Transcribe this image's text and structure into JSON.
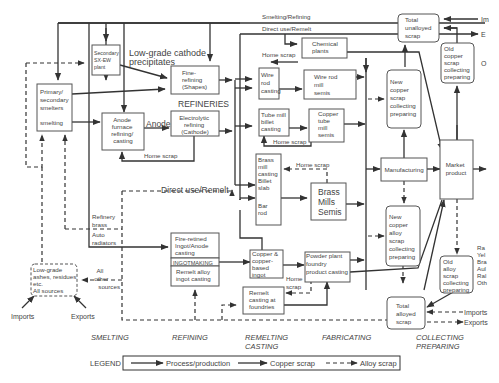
{
  "diagram": {
    "nodes": {
      "primary_smelters": [
        "Primary/",
        "secondary",
        "smelters",
        "",
        "smelting"
      ],
      "secondary_sxew": [
        "Secondary",
        "SX-EW",
        "plant"
      ],
      "fine_refining": [
        "Fine-",
        "refining",
        "(Shapes)"
      ],
      "anode_furnace": [
        "Anode",
        "furnace",
        "refining/",
        "casting"
      ],
      "electrolytic": [
        "Electrolytic",
        "refining",
        "(Cathode)"
      ],
      "chemical_plants": [
        "Chemical",
        "plants"
      ],
      "wire_rod_casting": [
        "Wire",
        "rod",
        "casting"
      ],
      "wire_rod_semis": [
        "Wire rod",
        "mill",
        "semis"
      ],
      "tube_billet": [
        "Tube mill",
        "billet",
        "casting"
      ],
      "copper_tube_semis": [
        "Copper",
        "tube",
        "mill",
        "semis"
      ],
      "brass_mill_casting": [
        "Brass",
        "mill",
        "casting",
        "Billet",
        "slab",
        "",
        "Bar",
        "rod"
      ],
      "brass_mills_semis": [
        "Brass",
        "Mills",
        "Semis"
      ],
      "new_copper_scrap": [
        "New",
        "copper",
        "scrap",
        "collecting",
        "preparing"
      ],
      "total_unalloyed": [
        "Total",
        "unalloyed",
        "scrap"
      ],
      "old_copper_scrap": [
        "Old",
        "copper",
        "scrap",
        "collecting",
        "preparing"
      ],
      "manufacturing": [
        "Manufacturing"
      ],
      "market_product": [
        "Market",
        "product"
      ],
      "new_alloy_scrap": [
        "New",
        "copper",
        "alloy",
        "scrap",
        "collecting",
        "preparing"
      ],
      "old_alloy_scrap": [
        "Old",
        "alloy",
        "scrap",
        "collecting",
        "preparing"
      ],
      "total_alloyed": [
        "Total",
        "alloyed",
        "scrap"
      ],
      "fire_refined": [
        "Fire-retined",
        "Ingot/Anode",
        "casting"
      ],
      "ingotmaking": "INGOTMAKING",
      "remelt_alloy": [
        "Remelt alloy",
        "ingot casting"
      ],
      "copper_based_ingot": [
        "Copper &",
        "copper-",
        "based",
        "ingot"
      ],
      "powder_plant": [
        "Powder plant",
        "foundry",
        "product casting"
      ],
      "remelt_foundries": [
        "Remelt",
        "casting at",
        "foundries"
      ],
      "low_grade": [
        "Low-grade",
        "ashes, residues",
        "etc.",
        "All sources"
      ]
    },
    "labels": {
      "smelting_refining": "Smelting/Refining",
      "direct_use_remelt_top": "Direct use/Remelt",
      "low_grade_cathode": [
        "Low-grade cathode",
        "precipitates"
      ],
      "refineries": "REFINERIES",
      "anode": "Anode",
      "home_scrap_anode": "Home scrap",
      "home_scrap_wire": "Home scrap",
      "home_scrap_tube": "Home scrap",
      "home_scrap_brass": "Home scrap",
      "home_scrap_powder": [
        "Home",
        "scrap"
      ],
      "direct_use_remelt_mid": "Direct use/Remelt",
      "refinery_brass": [
        "Refinery",
        "brass"
      ],
      "auto_radiators": [
        "Auto",
        "radiators"
      ],
      "all_other_sources": [
        "All",
        "other",
        "sources"
      ],
      "imports_left": "Imports",
      "exports_left": "Exports",
      "imports_right": "Imports",
      "exports_right": "Exports",
      "im_cut": "Im",
      "e_cut": "E",
      "o_cut": "O",
      "right_cut_list": [
        "Ra",
        "Yel",
        "Bra",
        "Aul",
        "Ral",
        "Oth"
      ]
    },
    "stages": [
      "SMELTING",
      "REFINING",
      [
        "REMELTING",
        "CASTING"
      ],
      "FABRICATING",
      [
        "COLLECTING",
        "PREPARING"
      ]
    ],
    "legend": {
      "title": "LEGEND",
      "items": [
        "Process/production",
        "Copper scrap",
        "Alloy scrap"
      ]
    }
  }
}
